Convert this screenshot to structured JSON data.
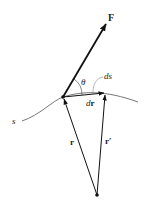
{
  "diagram": {
    "type": "vector-diagram",
    "labels": {
      "force": "F",
      "angle": "θ",
      "arc_length": "ds",
      "displacement_d": "d",
      "displacement_r": "r",
      "path": "s",
      "position": "r",
      "position_prime": "r′"
    },
    "colors": {
      "vector": "#111111",
      "curve": "#777777",
      "leader": "#999999",
      "text": "#222222"
    }
  }
}
